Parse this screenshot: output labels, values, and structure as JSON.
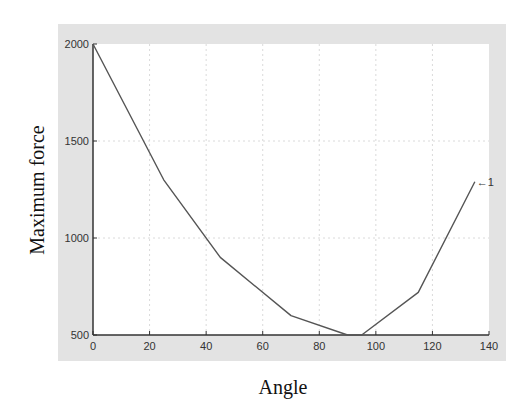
{
  "chart_data": {
    "type": "line",
    "title": "",
    "xlabel": "Angle",
    "ylabel": "Maximum force",
    "xlim": [
      0,
      140
    ],
    "ylim": [
      500,
      2000
    ],
    "xticks": [
      0,
      20,
      40,
      60,
      80,
      100,
      120,
      140
    ],
    "yticks": [
      500,
      1000,
      1500,
      2000
    ],
    "grid": true,
    "legend": null,
    "series": [
      {
        "name": "1",
        "x": [
          0,
          25,
          45,
          70,
          90,
          95,
          115,
          135
        ],
        "y": [
          2000,
          1300,
          900,
          600,
          500,
          500,
          720,
          1290
        ]
      }
    ],
    "annotations": [
      {
        "text": "←1",
        "x": 135,
        "y": 1290
      }
    ]
  },
  "axes": {
    "xlabel": "Angle",
    "ylabel": "Maximum force"
  },
  "colors": {
    "figure_bg": "#e3e3e3",
    "plot_bg": "#ffffff",
    "line": "#555555",
    "grid": "#d0d0d0",
    "axis": "#333333"
  }
}
